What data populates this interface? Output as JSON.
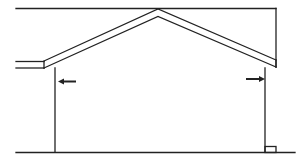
{
  "diagram": {
    "colors": {
      "line": "#222222",
      "background": "#ffffff"
    },
    "elements": {
      "ceiling_line": "top horizontal line",
      "roof": "gable roof with two sloped rafters",
      "left_eave": "left roof overhang",
      "left_wall": "left wall",
      "right_wall": "right wall",
      "ground": "ground line",
      "left_arrow": {
        "direction": "left",
        "icon": "arrow-left-icon"
      },
      "right_arrow": {
        "direction": "right",
        "icon": "arrow-right-icon"
      },
      "footing": "small footing block at base of right wall"
    }
  }
}
